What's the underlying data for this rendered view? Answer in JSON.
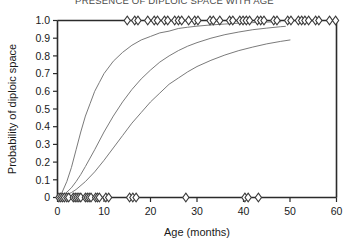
{
  "chart_data": {
    "type": "line",
    "title": "PRESENCE OF DIPLOIC SPACE WITH AGE",
    "xlabel": "Age (months)",
    "ylabel": "Probability of diploic space",
    "xlim": [
      0,
      60
    ],
    "ylim": [
      0,
      1.0
    ],
    "grid": false,
    "legend": "none",
    "xticks": [
      0,
      10,
      20,
      30,
      40,
      50,
      60
    ],
    "xtick_labels": [
      "0",
      "10",
      "20",
      "30",
      "40",
      "50",
      "60"
    ],
    "yticks": [
      0,
      0.1,
      0.2,
      0.3,
      0.4,
      0.5,
      0.6,
      0.7,
      0.8,
      0.9,
      1.0
    ],
    "ytick_labels": [
      "0",
      "0.1",
      "0.2",
      "0.3",
      "0.4",
      "0.5",
      "0.6",
      "0.7",
      "0.8",
      "0.9",
      "1.0"
    ],
    "line_color": "#6b6b6b",
    "marker_color": "#3a3a3a",
    "marker_symbol": "diamond",
    "series": [
      {
        "name": "curve-upper",
        "x": [
          0.3,
          1,
          2,
          3,
          4,
          5,
          6,
          7,
          8,
          9,
          10,
          12,
          14,
          16,
          18,
          20,
          22,
          24,
          26,
          28,
          30,
          33,
          36,
          39,
          42,
          45,
          48
        ],
        "values": [
          0.01,
          0.03,
          0.09,
          0.17,
          0.27,
          0.37,
          0.46,
          0.53,
          0.6,
          0.65,
          0.7,
          0.77,
          0.82,
          0.86,
          0.89,
          0.91,
          0.93,
          0.94,
          0.955,
          0.962,
          0.968,
          0.975,
          0.98,
          0.985,
          0.988,
          0.991,
          0.993
        ]
      },
      {
        "name": "curve-middle",
        "x": [
          0.3,
          1,
          2,
          3,
          4,
          5,
          6,
          8,
          10,
          12,
          14,
          16,
          18,
          20,
          22,
          24,
          26,
          28,
          30,
          33,
          36,
          39,
          42,
          45,
          48,
          49
        ],
        "values": [
          0.004,
          0.01,
          0.03,
          0.055,
          0.09,
          0.13,
          0.175,
          0.27,
          0.37,
          0.46,
          0.54,
          0.61,
          0.67,
          0.72,
          0.765,
          0.8,
          0.83,
          0.855,
          0.875,
          0.9,
          0.92,
          0.935,
          0.948,
          0.957,
          0.965,
          0.967
        ]
      },
      {
        "name": "curve-lower",
        "x": [
          0.3,
          1,
          2,
          3,
          4,
          6,
          8,
          10,
          12,
          14,
          16,
          18,
          20,
          22,
          24,
          26,
          28,
          30,
          33,
          36,
          39,
          42,
          45,
          48,
          50
        ],
        "values": [
          0.002,
          0.006,
          0.015,
          0.028,
          0.045,
          0.09,
          0.145,
          0.21,
          0.28,
          0.35,
          0.42,
          0.48,
          0.54,
          0.59,
          0.64,
          0.675,
          0.71,
          0.74,
          0.775,
          0.805,
          0.83,
          0.85,
          0.868,
          0.882,
          0.89
        ]
      }
    ],
    "scatter_top": {
      "name": "observations-present",
      "y": 1.0,
      "x": [
        15.0,
        16.6,
        17.3,
        19.4,
        20.8,
        21.5,
        23.0,
        23.7,
        25.2,
        26.0,
        26.7,
        28.2,
        29.5,
        30.2,
        32.8,
        33.5,
        34.9,
        37.0,
        37.7,
        39.2,
        39.9,
        40.6,
        41.3,
        43.0,
        43.7,
        44.4,
        46.5,
        47.2,
        49.5,
        50.2,
        51.8,
        52.5,
        53.2,
        54.0,
        55.5,
        56.2,
        58.5,
        59.8
      ]
    },
    "scatter_bottom": {
      "name": "observations-absent",
      "y": 0.0,
      "x": [
        0.3,
        0.7,
        1.1,
        1.5,
        2.0,
        2.4,
        3.4,
        3.8,
        4.2,
        4.6,
        5.0,
        6.0,
        6.4,
        6.8,
        7.2,
        8.2,
        8.6,
        9.0,
        10.4,
        11.0,
        15.5,
        16.2,
        16.9,
        27.6,
        40.3,
        41.0,
        43.2
      ]
    }
  }
}
